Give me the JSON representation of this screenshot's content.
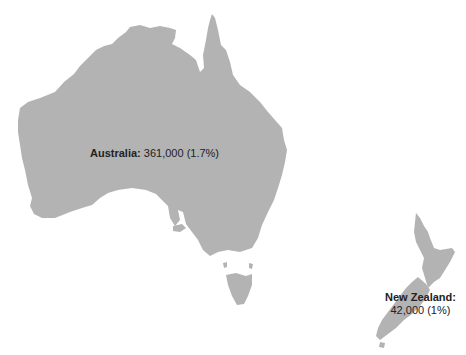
{
  "map": {
    "fill_color": "#b3b3b3",
    "background": "#ffffff",
    "regions": [
      {
        "name": "Australia",
        "label": "Australia:",
        "value": "361,000 (1.7%)"
      },
      {
        "name": "New Zealand",
        "label": "New Zealand:",
        "value": "42,000 (1%)"
      }
    ]
  }
}
